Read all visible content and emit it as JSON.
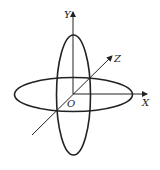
{
  "diagram": {
    "type": "3d-axes-with-ellipses",
    "axes": {
      "y": {
        "label": "Y"
      },
      "x": {
        "label": "X"
      },
      "z": {
        "label": "Z"
      },
      "origin": {
        "label": "O"
      }
    },
    "shapes": [
      {
        "name": "horizontal-ellipse",
        "plane": "XZ"
      },
      {
        "name": "vertical-ellipse",
        "plane": "YZ"
      }
    ],
    "colors": {
      "stroke": "#222222",
      "background": "#ffffff"
    }
  }
}
